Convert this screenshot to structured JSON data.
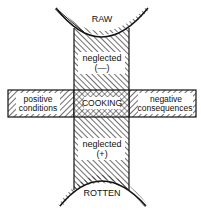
{
  "diagram": {
    "top_label": "RAW",
    "bottom_label": "ROTTEN",
    "center_label": "COOKING",
    "upper_box": {
      "line1": "neglected",
      "line2": "(—)"
    },
    "lower_box": {
      "line1": "neglected",
      "line2": "(+)"
    },
    "left_box": {
      "line1": "positive",
      "line2": "conditions"
    },
    "right_box": {
      "line1": "negative",
      "line2": "consequences"
    }
  }
}
